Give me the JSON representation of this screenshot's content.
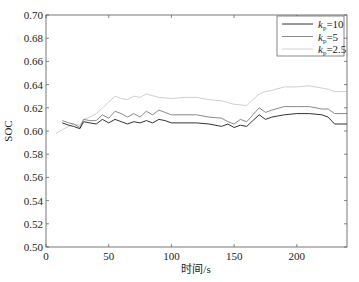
{
  "chart_data": {
    "type": "line",
    "title": "",
    "xlabel": "时间/s",
    "ylabel": "SOC",
    "xlim": [
      0,
      240
    ],
    "ylim": [
      0.5,
      0.7
    ],
    "xticks": [
      0,
      50,
      100,
      150,
      200
    ],
    "xtick_labels": [
      "0",
      "50",
      "100",
      "150",
      "200"
    ],
    "yticks": [
      0.5,
      0.52,
      0.54,
      0.56,
      0.58,
      0.6,
      0.62,
      0.64,
      0.66,
      0.68,
      0.7
    ],
    "ytick_labels": [
      "0.50",
      "0.52",
      "0.54",
      "0.56",
      "0.58",
      "0.60",
      "0.62",
      "0.64",
      "0.66",
      "0.68",
      "0.70"
    ],
    "grid": false,
    "legend_position": "upper right",
    "series": [
      {
        "name": "kp=10",
        "legend_main": "k",
        "legend_sub": "p",
        "legend_value": "=10",
        "color": "#333333",
        "x": [
          13,
          18,
          22,
          27,
          30,
          35,
          40,
          45,
          50,
          55,
          60,
          65,
          70,
          75,
          80,
          85,
          90,
          95,
          100,
          110,
          120,
          130,
          140,
          145,
          150,
          155,
          160,
          165,
          170,
          175,
          180,
          190,
          200,
          210,
          220,
          225,
          230,
          240
        ],
        "y": [
          0.607,
          0.605,
          0.604,
          0.602,
          0.608,
          0.607,
          0.606,
          0.61,
          0.607,
          0.61,
          0.608,
          0.606,
          0.608,
          0.607,
          0.609,
          0.607,
          0.61,
          0.609,
          0.607,
          0.607,
          0.607,
          0.606,
          0.604,
          0.606,
          0.603,
          0.605,
          0.604,
          0.609,
          0.614,
          0.61,
          0.612,
          0.614,
          0.615,
          0.615,
          0.614,
          0.612,
          0.606,
          0.606
        ]
      },
      {
        "name": "kp=5",
        "legend_main": "k",
        "legend_sub": "p",
        "legend_value": "=5",
        "color": "#8a8a8a",
        "x": [
          13,
          18,
          22,
          27,
          30,
          35,
          40,
          45,
          50,
          55,
          60,
          65,
          70,
          75,
          80,
          85,
          90,
          95,
          100,
          110,
          120,
          130,
          140,
          145,
          150,
          155,
          160,
          165,
          170,
          175,
          180,
          190,
          200,
          210,
          220,
          225,
          230,
          240
        ],
        "y": [
          0.609,
          0.607,
          0.606,
          0.603,
          0.61,
          0.609,
          0.609,
          0.614,
          0.611,
          0.617,
          0.615,
          0.612,
          0.615,
          0.612,
          0.617,
          0.614,
          0.618,
          0.616,
          0.614,
          0.614,
          0.614,
          0.612,
          0.611,
          0.608,
          0.606,
          0.61,
          0.608,
          0.614,
          0.62,
          0.616,
          0.618,
          0.621,
          0.621,
          0.621,
          0.619,
          0.619,
          0.615,
          0.615
        ]
      },
      {
        "name": "kp=2.5",
        "legend_main": "k",
        "legend_sub": "p",
        "legend_value": "=2.5",
        "color": "#d0d0d0",
        "x": [
          8,
          13,
          18,
          22,
          27,
          30,
          35,
          40,
          45,
          50,
          55,
          60,
          65,
          70,
          75,
          80,
          90,
          100,
          110,
          120,
          130,
          140,
          150,
          160,
          165,
          170,
          175,
          180,
          190,
          200,
          210,
          220,
          225,
          230,
          240
        ],
        "y": [
          0.598,
          0.601,
          0.604,
          0.606,
          0.605,
          0.61,
          0.612,
          0.615,
          0.62,
          0.625,
          0.63,
          0.628,
          0.627,
          0.63,
          0.629,
          0.632,
          0.629,
          0.628,
          0.629,
          0.629,
          0.627,
          0.626,
          0.623,
          0.622,
          0.627,
          0.632,
          0.634,
          0.635,
          0.638,
          0.638,
          0.639,
          0.637,
          0.636,
          0.634,
          0.634
        ]
      }
    ]
  }
}
